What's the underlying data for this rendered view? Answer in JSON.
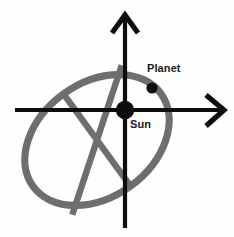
{
  "diagram": {
    "type": "orbit-schematic",
    "background_color": "#fefefe",
    "width": 234,
    "height": 237,
    "axes": {
      "vertical": {
        "name": "vertical-axis",
        "color": "#0d0d0d",
        "arrowhead": "up",
        "x": 125,
        "y_top": 14,
        "y_bottom": 228
      },
      "horizontal": {
        "name": "horizontal-axis",
        "color": "#0d0d0d",
        "arrowhead": "right",
        "y": 110,
        "x_left": 15,
        "x_right": 224
      },
      "origin": {
        "x": 125,
        "y": 110
      }
    },
    "orbit": {
      "name": "elliptical-orbit",
      "shape": "ellipse",
      "color": "#6e6e6e",
      "stroke_width": 7.2,
      "center_x": 97,
      "center_y": 140,
      "radius_x": 79,
      "radius_y": 57,
      "rotation_deg": -36,
      "major_axis": {
        "color": "#6e6e6e",
        "stroke_width": 6.4
      },
      "minor_axis": {
        "color": "#6e6e6e",
        "stroke_width": 6.4
      }
    },
    "bodies": [
      {
        "key": "sun",
        "label": "Sun",
        "color": "#0d0d0d",
        "x": 125,
        "y": 110,
        "radius": 9.2,
        "label_x": 130,
        "label_y": 119
      },
      {
        "key": "planet",
        "label": "Planet",
        "color": "#0d0d0d",
        "x": 152,
        "y": 88,
        "radius": 5.6,
        "label_x": 147,
        "label_y": 63
      }
    ]
  }
}
